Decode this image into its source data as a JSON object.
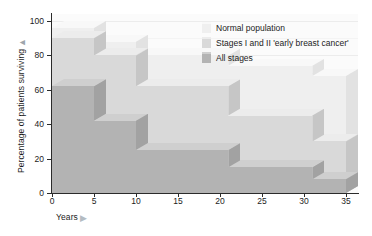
{
  "chart_data": {
    "type": "area",
    "title": "",
    "xlabel": "Years",
    "ylabel": "Percentage of patients surviving",
    "xlim": [
      0,
      35
    ],
    "ylim": [
      0,
      100
    ],
    "xticks": [
      "0",
      "5",
      "10",
      "15",
      "20",
      "25",
      "30",
      "35"
    ],
    "yticks": [
      "0",
      "20",
      "40",
      "60",
      "80",
      "100"
    ],
    "grid": true,
    "legend_position": "top-right",
    "step_edges": [
      0,
      5,
      10,
      21,
      31,
      35
    ],
    "series": [
      {
        "name": "Normal population",
        "color": "#efefef",
        "top_color": "#f8f8f8",
        "side_color": "#e2e2e2",
        "values": [
          96,
          88,
          80,
          74,
          68
        ]
      },
      {
        "name": "Stages I and II 'early breast cancer'",
        "color": "#d9d9d9",
        "top_color": "#ececec",
        "side_color": "#c6c6c6",
        "values": [
          90,
          80,
          62,
          45,
          30
        ]
      },
      {
        "name": "All stages",
        "color": "#b3b3b3",
        "top_color": "#cfcfcf",
        "side_color": "#a2a2a2",
        "values": [
          62,
          42,
          25,
          15,
          8
        ]
      }
    ]
  },
  "legend": {
    "items": [
      {
        "label": "Normal population"
      },
      {
        "label": "Stages I and II 'early breast cancer'"
      },
      {
        "label": "All stages"
      }
    ]
  },
  "axis": {
    "y_arrow": "▲",
    "x_arrow": "▶"
  }
}
